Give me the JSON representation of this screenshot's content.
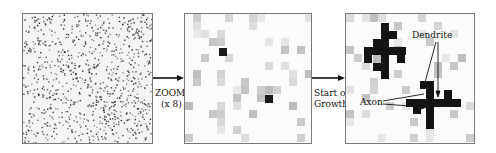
{
  "figure": {
    "panels": [
      {
        "id": "panel-noise",
        "description": "Random noise field (initial state)"
      },
      {
        "id": "panel-zoomed",
        "description": "Zoomed view of noise with two seed cells"
      },
      {
        "id": "panel-growth",
        "description": "Grown neurons with axon and dendrite"
      }
    ],
    "arrow_1": {
      "line1": "ZOOM",
      "line2": "(x 8)"
    },
    "arrow_2": {
      "line1": "Start of",
      "line2": "Growth"
    },
    "annotations": {
      "dendrite": "Dendrite",
      "axon": "Axon"
    },
    "colors": {
      "frame": "#7a7a7a",
      "seed": "#1a1a1a",
      "noise_light": "#d9d9d9",
      "noise_mid": "#bdbdbd"
    }
  }
}
